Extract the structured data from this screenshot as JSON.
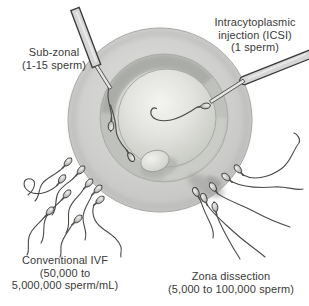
{
  "figure": {
    "type": "medical-diagram",
    "labels": {
      "sub_zonal": "Sub-zonal\n(1-15 sperm)",
      "icsi": "Intracytoplasmic\ninjection (ICSI)\n(1 sperm)",
      "conventional_ivf": "Conventional IVF\n(50,000 to\n5,000,000 sperm/mL)",
      "zona_dissection": "Zona dissection\n(5,000 to 100,000 sperm)"
    },
    "techniques": [
      {
        "name": "Sub-zonal",
        "sperm_count": "1-15 sperm"
      },
      {
        "name": "Intracytoplasmic injection (ICSI)",
        "sperm_count": "1 sperm"
      },
      {
        "name": "Conventional IVF",
        "sperm_count": "50,000 to 5,000,000 sperm/mL"
      },
      {
        "name": "Zona dissection",
        "sperm_count": "5,000 to 100,000 sperm"
      }
    ],
    "colors": {
      "background": "#ffffff",
      "text": "#3a3a3a",
      "egg_outer": "#cfcfcd",
      "egg_zona_ring": "#bfc1bd",
      "egg_ooplasm_highlight": "#f4f4f2",
      "egg_ooplasm_edge": "#c3c5c1",
      "sperm_outline": "#3e3e3c",
      "pipette_fill": "#d6d6d6",
      "pipette_outline": "#3a3a3a"
    }
  }
}
